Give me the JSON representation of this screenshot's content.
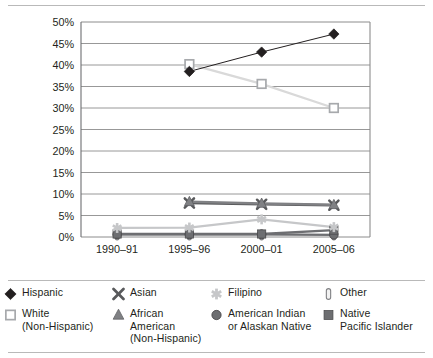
{
  "chart_data": {
    "type": "line",
    "title": "",
    "subtitle": "",
    "xlabel": "",
    "ylabel": "",
    "categories": [
      "1990–91",
      "1995–96",
      "2000–01",
      "2005–06"
    ],
    "ylim": [
      0,
      50
    ],
    "ytick_step": 5,
    "ytick_labels": [
      "0%",
      "5%",
      "10%",
      "15%",
      "20%",
      "25%",
      "30%",
      "35%",
      "40%",
      "45%",
      "50%"
    ],
    "grid": "horizontal",
    "legend_position": "bottom",
    "series": [
      {
        "name": "Hispanic",
        "marker": "filled-diamond",
        "color": "#231f20",
        "values": [
          null,
          38.5,
          43.0,
          47.2
        ]
      },
      {
        "name": "White (Non-Hispanic)",
        "marker": "open-square",
        "color": "#d9d9d9",
        "values": [
          null,
          40.2,
          35.6,
          30.0
        ]
      },
      {
        "name": "Asian",
        "marker": "x-cross",
        "color": "#58595b",
        "values": [
          null,
          7.9,
          7.6,
          7.4
        ]
      },
      {
        "name": "African American (Non-Hispanic)",
        "marker": "filled-triangle",
        "color": "#808184",
        "values": [
          null,
          8.2,
          7.8,
          7.5
        ]
      },
      {
        "name": "Filipino",
        "marker": "asterisk",
        "color": "#c6c7c9",
        "values": [
          2.1,
          2.2,
          4.1,
          2.3
        ]
      },
      {
        "name": "American Indian or Alaskan Native",
        "marker": "filled-circle",
        "color": "#6d6e71",
        "values": [
          0.6,
          0.6,
          0.6,
          0.5
        ]
      },
      {
        "name": "Other",
        "marker": "capsule",
        "color": "#e6e6e6",
        "values": [
          0.5,
          0.5,
          0.5,
          0.5
        ]
      },
      {
        "name": "Native Pacific Islander",
        "marker": "filled-square",
        "color": "#6d6e71",
        "values": [
          0.7,
          0.7,
          0.7,
          1.6
        ]
      }
    ]
  },
  "legend": {
    "entries": [
      {
        "label": "Hispanic",
        "marker": "filled-diamond"
      },
      {
        "label": "Asian",
        "marker": "x-cross"
      },
      {
        "label": "Filipino",
        "marker": "asterisk"
      },
      {
        "label": "Other",
        "marker": "capsule"
      },
      {
        "label": "White\n(Non-Hispanic)",
        "marker": "open-square"
      },
      {
        "label": "African American\n(Non-Hispanic)",
        "marker": "filled-triangle"
      },
      {
        "label": "American Indian\nor Alaskan Native",
        "marker": "filled-circle"
      },
      {
        "label": "Native\nPacific Islander",
        "marker": "filled-square"
      }
    ]
  },
  "style": {
    "text_color": "#231f20",
    "grid_color": "#8c8c8c",
    "axis_color": "#6d6e71",
    "rule_color": "#b9b9b9"
  }
}
